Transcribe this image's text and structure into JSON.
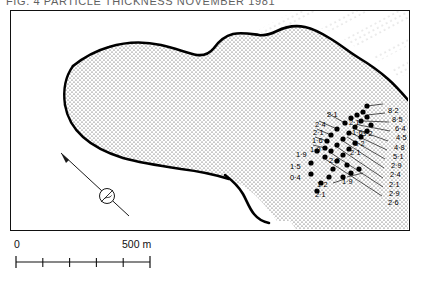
{
  "caption": {
    "text": "FIG. 4  PARTICLE THICKNESS  NOVEMBER 1981"
  },
  "figure": {
    "frame_border_color": "#111111",
    "land_fill_pattern": "stipple",
    "coast_line_color": "#000000",
    "point_color": "#000000",
    "background": "#ffffff"
  },
  "north_arrow": {
    "name": "magnetic-north-arrow",
    "symbol": "circled-slash",
    "bearing_deg": -35
  },
  "scale_bar": {
    "start_label": "0",
    "end_label": "500 m",
    "divisions": 5,
    "unit": "m",
    "length_value": 500
  },
  "measurements": {
    "units": "m",
    "left_group": [
      {
        "label": "1·9",
        "x": 296,
        "y": 150,
        "px": 316,
        "py": 150
      },
      {
        "label": "1·5",
        "x": 290,
        "y": 162,
        "px": 310,
        "py": 162
      },
      {
        "label": "0·4",
        "x": 290,
        "y": 173,
        "px": 310,
        "py": 173
      }
    ],
    "upper_group": [
      {
        "label": "2·1",
        "x": 327,
        "y": 110,
        "px": 345,
        "py": 122
      },
      {
        "label": "2·4",
        "x": 315,
        "y": 120,
        "px": 336,
        "py": 128
      },
      {
        "label": "2·1",
        "x": 313,
        "y": 128,
        "px": 331,
        "py": 134
      },
      {
        "label": "1·6",
        "x": 312,
        "y": 136,
        "px": 327,
        "py": 140
      },
      {
        "label": "1·9",
        "x": 310,
        "y": 145,
        "px": 324,
        "py": 147
      }
    ],
    "center_group": [
      {
        "label": "2·1",
        "x": 349,
        "y": 118
      },
      {
        "label": "1·6",
        "x": 352,
        "y": 128
      },
      {
        "label": "3·2",
        "x": 362,
        "y": 129
      },
      {
        "label": "3·2",
        "x": 354,
        "y": 139
      },
      {
        "label": "2·1",
        "x": 350,
        "y": 148
      },
      {
        "label": "2·9",
        "x": 329,
        "y": 156
      }
    ],
    "lower_group": [
      {
        "label": "1·2",
        "x": 317,
        "y": 180
      },
      {
        "label": "2·1",
        "x": 315,
        "y": 190
      },
      {
        "label": "1·9",
        "x": 342,
        "y": 177
      }
    ],
    "right_column": [
      {
        "label": "8·2",
        "x": 388,
        "y": 106
      },
      {
        "label": "8·5",
        "x": 392,
        "y": 115
      },
      {
        "label": "6·4",
        "x": 395,
        "y": 124
      },
      {
        "label": "4·5",
        "x": 396,
        "y": 133
      },
      {
        "label": "4·8",
        "x": 394,
        "y": 143
      },
      {
        "label": "5·1",
        "x": 393,
        "y": 152
      },
      {
        "label": "2·9",
        "x": 391,
        "y": 161
      },
      {
        "label": "2·4",
        "x": 390,
        "y": 170
      },
      {
        "label": "2·1",
        "x": 389,
        "y": 180
      },
      {
        "label": "2·9",
        "x": 389,
        "y": 189
      },
      {
        "label": "2·6",
        "x": 388,
        "y": 198
      }
    ]
  }
}
